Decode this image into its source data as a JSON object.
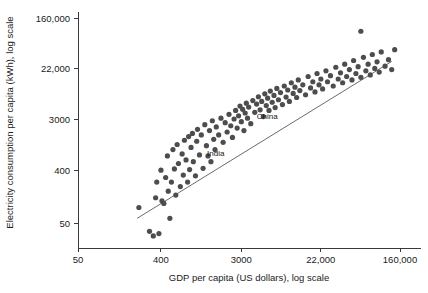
{
  "chart_data": {
    "type": "scatter",
    "title": "",
    "xlabel": "GDP per capita (US dollars), log scale",
    "ylabel": "Electricity consumption per capita (kWh), log scale",
    "xscale": "log",
    "yscale": "log",
    "grid": false,
    "legend": null,
    "xlim": [
      50,
      160000
    ],
    "ylim": [
      50,
      160000
    ],
    "xticks": [
      50,
      400,
      3000,
      22000,
      160000
    ],
    "xticklabels": [
      "50",
      "400",
      "3000",
      "22,000",
      "160,000"
    ],
    "yticks": [
      50,
      400,
      3000,
      22000,
      160000
    ],
    "yticklabels": [
      "50",
      "400",
      "3000",
      "22,000",
      "160,000"
    ],
    "series": [
      {
        "name": "countries",
        "marker": "circle",
        "color": "#4d4d4d",
        "points": [
          [
            230,
            92
          ],
          [
            300,
            36
          ],
          [
            330,
            30
          ],
          [
            350,
            135
          ],
          [
            360,
            250
          ],
          [
            380,
            33
          ],
          [
            400,
            400
          ],
          [
            410,
            120
          ],
          [
            430,
            108
          ],
          [
            450,
            300
          ],
          [
            470,
            700
          ],
          [
            480,
            175
          ],
          [
            500,
            60
          ],
          [
            520,
            250
          ],
          [
            540,
            900
          ],
          [
            560,
            420
          ],
          [
            580,
            150
          ],
          [
            600,
            1100
          ],
          [
            620,
            520
          ],
          [
            650,
            210
          ],
          [
            680,
            760
          ],
          [
            700,
            330
          ],
          [
            720,
            1300
          ],
          [
            750,
            600
          ],
          [
            780,
            250
          ],
          [
            800,
            1500
          ],
          [
            820,
            410
          ],
          [
            850,
            980
          ],
          [
            880,
            1700
          ],
          [
            900,
            560
          ],
          [
            950,
            320
          ],
          [
            980,
            1250
          ],
          [
            1000,
            2000
          ],
          [
            1050,
            730
          ],
          [
            1100,
            1600
          ],
          [
            1150,
            430
          ],
          [
            1200,
            2400
          ],
          [
            1250,
            1050
          ],
          [
            1300,
            700
          ],
          [
            1350,
            1900
          ],
          [
            1400,
            560
          ],
          [
            1450,
            2800
          ],
          [
            1500,
            1350
          ],
          [
            1550,
            900
          ],
          [
            1600,
            2200
          ],
          [
            1700,
            1600
          ],
          [
            1800,
            3100
          ],
          [
            1900,
            1200
          ],
          [
            2000,
            2600
          ],
          [
            2100,
            1800
          ],
          [
            2200,
            3600
          ],
          [
            2300,
            2300
          ],
          [
            2400,
            1450
          ],
          [
            2500,
            3000
          ],
          [
            2600,
            4200
          ],
          [
            2700,
            2100
          ],
          [
            2800,
            3400
          ],
          [
            2900,
            5000
          ],
          [
            3000,
            2700
          ],
          [
            3100,
            4400
          ],
          [
            3200,
            1900
          ],
          [
            3300,
            3800
          ],
          [
            3400,
            5600
          ],
          [
            3500,
            3100
          ],
          [
            3600,
            4800
          ],
          [
            3800,
            2500
          ],
          [
            4000,
            6200
          ],
          [
            4200,
            3900
          ],
          [
            4400,
            5400
          ],
          [
            4600,
            7200
          ],
          [
            4800,
            4300
          ],
          [
            5000,
            6000
          ],
          [
            5200,
            3300
          ],
          [
            5400,
            8100
          ],
          [
            5600,
            5100
          ],
          [
            5800,
            6800
          ],
          [
            6000,
            4200
          ],
          [
            6200,
            9000
          ],
          [
            6500,
            5800
          ],
          [
            6800,
            7600
          ],
          [
            7000,
            4700
          ],
          [
            7300,
            10000
          ],
          [
            7600,
            6400
          ],
          [
            8000,
            8500
          ],
          [
            8400,
            5300
          ],
          [
            8800,
            11000
          ],
          [
            9200,
            7100
          ],
          [
            9600,
            9400
          ],
          [
            10000,
            6000
          ],
          [
            10500,
            12500
          ],
          [
            11000,
            8200
          ],
          [
            11500,
            10500
          ],
          [
            12000,
            7000
          ],
          [
            12500,
            14000
          ],
          [
            13000,
            9200
          ],
          [
            14000,
            11500
          ],
          [
            15000,
            7800
          ],
          [
            16000,
            16000
          ],
          [
            17000,
            10200
          ],
          [
            18000,
            13000
          ],
          [
            19000,
            8700
          ],
          [
            20000,
            18000
          ],
          [
            21000,
            11500
          ],
          [
            22000,
            14500
          ],
          [
            23000,
            9800
          ],
          [
            25000,
            20000
          ],
          [
            26000,
            13000
          ],
          [
            28000,
            16500
          ],
          [
            30000,
            11000
          ],
          [
            32000,
            23000
          ],
          [
            34000,
            14500
          ],
          [
            36000,
            18500
          ],
          [
            38000,
            12500
          ],
          [
            40000,
            26000
          ],
          [
            42000,
            16000
          ],
          [
            45000,
            21000
          ],
          [
            48000,
            14000
          ],
          [
            50000,
            30000
          ],
          [
            53000,
            18000
          ],
          [
            56000,
            23500
          ],
          [
            60000,
            15500
          ],
          [
            64000,
            34000
          ],
          [
            68000,
            20000
          ],
          [
            72000,
            26000
          ],
          [
            76000,
            17000
          ],
          [
            80000,
            38000
          ],
          [
            85000,
            22000
          ],
          [
            90000,
            28500
          ],
          [
            95000,
            19000
          ],
          [
            100000,
            42000
          ],
          [
            110000,
            24000
          ],
          [
            120000,
            31000
          ],
          [
            130000,
            21000
          ],
          [
            140000,
            46000
          ],
          [
            60000,
            95000
          ]
        ]
      }
    ],
    "annotations": [
      {
        "label": "China",
        "x": 4000,
        "y": 3400
      },
      {
        "label": "India",
        "x": 1150,
        "y": 800
      }
    ],
    "trend_line": {
      "style": "solid",
      "color": "#6b6b6b",
      "x_start": 220,
      "y_start": 60,
      "x_end": 130000,
      "y_end": 29000
    }
  }
}
